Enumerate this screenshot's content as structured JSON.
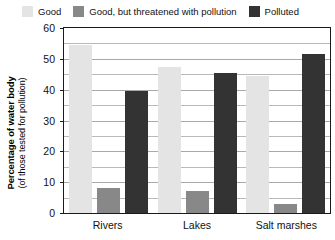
{
  "legend": {
    "items": [
      {
        "label": "Good",
        "color": "#e4e4e4",
        "swatch_name": "legend-swatch-good"
      },
      {
        "label": "Good, but threatened with pollution",
        "color": "#888888",
        "swatch_name": "legend-swatch-threatened"
      },
      {
        "label": "Polluted",
        "color": "#333333",
        "swatch_name": "legend-swatch-polluted"
      }
    ]
  },
  "axis": {
    "ytitle_main": "Percentage of water body",
    "ytitle_sub": "(of those tested for pollution)",
    "yticks": [
      "60",
      "50",
      "40",
      "30",
      "20",
      "10",
      "0"
    ]
  },
  "chart_data": {
    "type": "bar",
    "title": "",
    "xlabel": "",
    "ylabel": "Percentage of water body (of those tested for pollution)",
    "categories": [
      "Rivers",
      "Lakes",
      "Salt marshes"
    ],
    "series": [
      {
        "name": "Good",
        "color": "#e4e4e4",
        "values": [
          54,
          47,
          44
        ]
      },
      {
        "name": "Good, but threatened with pollution",
        "color": "#888888",
        "values": [
          8,
          7,
          3
        ]
      },
      {
        "name": "Polluted",
        "color": "#333333",
        "values": [
          39,
          45,
          51
        ]
      }
    ],
    "ylim": [
      0,
      60
    ],
    "ytick_step": 10,
    "gridline_step": 5,
    "grid": true,
    "legend_position": "top"
  }
}
